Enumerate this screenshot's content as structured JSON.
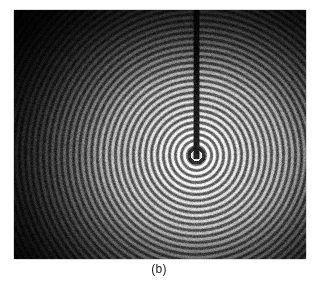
{
  "figure": {
    "caption": "(b)",
    "alt_description": "photograph-of-circular-water-waves-in-a-ripple-tank",
    "background_color": "#ffffff"
  },
  "photo": {
    "x": 14,
    "y": 10,
    "width": 292,
    "height": 249,
    "background_color": "#0a0a0a",
    "border_color": "#bdbdbd"
  },
  "chart_data": {
    "type": "heatmap",
    "title": "(b)",
    "subtitle": "",
    "xlabel": "",
    "ylabel": "",
    "legend": [],
    "grid": false,
    "source_point": {
      "x": 196,
      "y": 155,
      "x_fraction": 0.623,
      "y_fraction": 0.582
    },
    "ring_period_px": 6.0,
    "ring_count_visible": 26,
    "ring_bright_color": "#e8e8e8",
    "ring_dark_color": "#0d0d0d",
    "mid_tone_color": "#8a8a8a",
    "probe_rod": {
      "label": "vertical-dark-rod",
      "x_center": 196,
      "width_px": 5,
      "top_y": 10,
      "bottom_y": 158,
      "color": "#0a0a0a"
    },
    "vignette": {
      "enabled": true,
      "center_x_fraction": 0.62,
      "center_y_fraction": 0.58,
      "edge_darkness": 0.82
    },
    "grain": {
      "enabled": true,
      "opacity": 0.22
    },
    "xlim": [
      0,
      292
    ],
    "ylim": [
      0,
      249
    ]
  }
}
